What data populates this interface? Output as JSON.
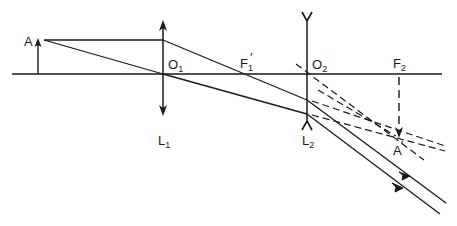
{
  "diagram": {
    "colors": {
      "ink": "#1a1a1a",
      "background": "#ffffff"
    },
    "labels": {
      "object": "A",
      "image": "A",
      "image_prime": "′",
      "o1_main": "O",
      "o1_sub": "1",
      "f1_main": "F",
      "f1_sub": "1",
      "f1_prime": "′",
      "o2_main": "O",
      "o2_sub": "2",
      "f2_main": "F",
      "f2_sub": "2",
      "l1_main": "L",
      "l1_sub": "1",
      "l2_main": "L",
      "l2_sub": "2"
    },
    "elements": {
      "optical_axis": "horizontal principal axis",
      "lens_1": "converging lens L1 (double-arrow line)",
      "lens_2": "diverging lens L2 (Y-ended line)",
      "object_arrow": "object A (upright arrow)",
      "image_arrow": "virtual image A′ (inverted dashed arrow at F2)",
      "rays": [
        "ray parallel to axis refracted through F1′",
        "ray through optical centre O1",
        "emergent parallel rays with arrowheads"
      ],
      "construction_lines": [
        "dashed backward extensions of emergent rays meeting at A′",
        "dashed auxiliary ray through O2"
      ]
    }
  }
}
